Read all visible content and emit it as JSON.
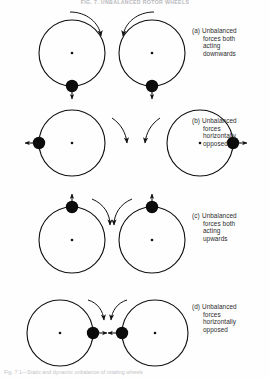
{
  "figure": {
    "top_title": "FIG. 7. UNBALANCED ROTOR WHEELS",
    "bottom_caption": "Fig. 7.1—Static and dynamic unbalance of rotating wheels",
    "background_color": "#fefefe",
    "ink_color": "#1a1a1a"
  },
  "rows": [
    {
      "tag": "(a)",
      "lines": [
        "Unbalanced",
        "forces  both",
        "acting",
        "downwards"
      ],
      "mass_position": "bottom",
      "force_direction": "down",
      "left_rotation": "clockwise",
      "right_rotation": "counter-clockwise"
    },
    {
      "tag": "(b)",
      "lines": [
        "Unbalanced",
        "forces",
        "horizontally",
        "opposed"
      ],
      "mass_position": "side-outer",
      "force_direction": "outward",
      "left_rotation": "clockwise",
      "right_rotation": "counter-clockwise"
    },
    {
      "tag": "(c)",
      "lines": [
        "Unbalanced",
        "forces  both",
        "acting",
        "upwards"
      ],
      "mass_position": "top",
      "force_direction": "up",
      "left_rotation": "clockwise",
      "right_rotation": "counter-clockwise"
    },
    {
      "tag": "(d)",
      "lines": [
        "Unbalanced",
        "forces",
        "horizontally",
        "opposed"
      ],
      "mass_position": "side-inner",
      "force_direction": "inward",
      "left_rotation": "clockwise",
      "right_rotation": "counter-clockwise"
    }
  ],
  "geometry": {
    "wheel_radius": 33,
    "mass_radius": 6,
    "hub_radius": 1.2
  }
}
